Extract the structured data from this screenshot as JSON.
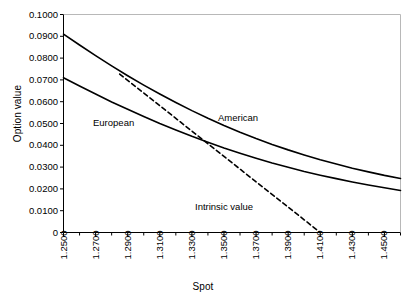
{
  "chart_data": {
    "type": "line",
    "title": "",
    "xlabel": "Spot",
    "ylabel": "Option value",
    "xlim": [
      1.25,
      1.46
    ],
    "ylim": [
      0,
      0.1
    ],
    "grid": false,
    "legend_position": "inline-annotations",
    "x_tick_labels": [
      "1.2500",
      "1.2700",
      "1.2900",
      "1.3100",
      "1.3300",
      "1.3500",
      "1.3700",
      "1.3900",
      "1.4100",
      "1.4300",
      "1.4500"
    ],
    "x_tick_values": [
      1.25,
      1.27,
      1.29,
      1.31,
      1.33,
      1.35,
      1.37,
      1.39,
      1.41,
      1.43,
      1.45
    ],
    "x_minor_tick_step": 0.01,
    "y_tick_labels": [
      "0.1000",
      "0.0900",
      "0.0800",
      "0.0700",
      "0.0600",
      "0.0500",
      "0.0400",
      "0.0300",
      "0.0200",
      "0.0100",
      "0"
    ],
    "y_tick_values": [
      0.1,
      0.09,
      0.08,
      0.07,
      0.06,
      0.05,
      0.04,
      0.03,
      0.02,
      0.01,
      0
    ],
    "series": [
      {
        "name": "American",
        "style": "solid",
        "color": "#000000",
        "annotation": "American",
        "x": [
          1.25,
          1.26,
          1.27,
          1.28,
          1.29,
          1.3,
          1.31,
          1.32,
          1.33,
          1.34,
          1.35,
          1.36,
          1.37,
          1.38,
          1.39,
          1.4,
          1.41,
          1.42,
          1.43,
          1.44,
          1.45,
          1.46
        ],
        "values": [
          0.091,
          0.086,
          0.0811,
          0.0764,
          0.0719,
          0.0676,
          0.0635,
          0.0596,
          0.0559,
          0.0524,
          0.0491,
          0.046,
          0.0431,
          0.0404,
          0.0379,
          0.0356,
          0.0334,
          0.0314,
          0.0295,
          0.0278,
          0.0262,
          0.0248
        ]
      },
      {
        "name": "European",
        "style": "solid",
        "color": "#000000",
        "annotation": "European",
        "x": [
          1.25,
          1.26,
          1.27,
          1.28,
          1.29,
          1.3,
          1.31,
          1.32,
          1.33,
          1.34,
          1.35,
          1.36,
          1.37,
          1.38,
          1.39,
          1.4,
          1.41,
          1.42,
          1.43,
          1.44,
          1.45,
          1.46
        ],
        "values": [
          0.071,
          0.0672,
          0.0635,
          0.0599,
          0.0565,
          0.0532,
          0.05,
          0.047,
          0.0441,
          0.0414,
          0.0388,
          0.0364,
          0.0341,
          0.0319,
          0.0299,
          0.028,
          0.0263,
          0.0247,
          0.0232,
          0.0218,
          0.0205,
          0.0193
        ]
      },
      {
        "name": "Intrinsic value",
        "style": "dashed",
        "color": "#000000",
        "annotation": "Intrinsic value",
        "x": [
          1.285,
          1.41
        ],
        "values": [
          0.0727,
          0.0
        ]
      }
    ]
  },
  "labels": {
    "ylabel": "Option value",
    "xlabel": "Spot",
    "european": "European",
    "american": "American",
    "intrinsic": "Intrinsic value"
  },
  "style": {
    "axis_color": "#000000",
    "curve_color": "#000000",
    "background": "#ffffff"
  }
}
